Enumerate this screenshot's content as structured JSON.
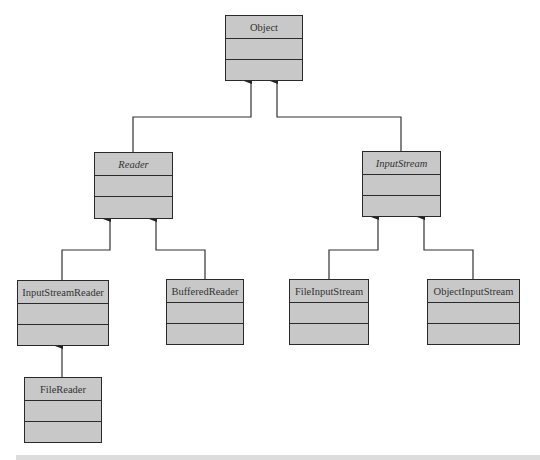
{
  "diagram": {
    "type": "UML class hierarchy",
    "classes": {
      "object": {
        "name": "Object",
        "abstract": false
      },
      "reader": {
        "name": "Reader",
        "abstract": true
      },
      "inputstream": {
        "name": "InputStream",
        "abstract": true
      },
      "inputstreamreader": {
        "name": "InputStreamReader",
        "abstract": false
      },
      "bufferedreader": {
        "name": "BufferedReader",
        "abstract": false
      },
      "fileinputstream": {
        "name": "FileInputStream",
        "abstract": false
      },
      "objectinputstream": {
        "name": "ObjectInputStream",
        "abstract": false
      },
      "filereader": {
        "name": "FileReader",
        "abstract": false
      }
    },
    "relationships": [
      {
        "from": "Reader",
        "to": "Object",
        "type": "inheritance"
      },
      {
        "from": "InputStream",
        "to": "Object",
        "type": "inheritance"
      },
      {
        "from": "InputStreamReader",
        "to": "Reader",
        "type": "inheritance"
      },
      {
        "from": "BufferedReader",
        "to": "Reader",
        "type": "inheritance"
      },
      {
        "from": "FileInputStream",
        "to": "InputStream",
        "type": "inheritance"
      },
      {
        "from": "ObjectInputStream",
        "to": "InputStream",
        "type": "inheritance"
      },
      {
        "from": "FileReader",
        "to": "InputStreamReader",
        "type": "inheritance"
      }
    ],
    "colors": {
      "box_fill": "#c8c8c8",
      "box_border": "#2a2a2a",
      "line": "#333333"
    }
  }
}
